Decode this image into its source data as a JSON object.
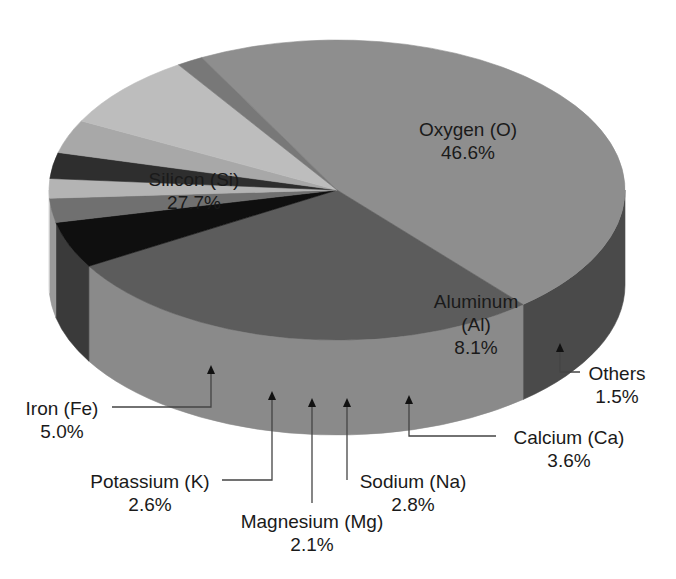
{
  "chart_data": {
    "type": "pie",
    "style": "3d",
    "title": "",
    "categories": [
      "Oxygen (O)",
      "Silicon (Si)",
      "Iron (Fe)",
      "Potassium (K)",
      "Magnesium (Mg)",
      "Sodium (Na)",
      "Calcium (Ca)",
      "Aluminum (Al)",
      "Others"
    ],
    "values": [
      46.6,
      27.7,
      5.0,
      2.6,
      2.1,
      2.8,
      3.6,
      8.1,
      1.5
    ],
    "unit": "%",
    "colors": {
      "Oxygen (O)": {
        "top": "#8e8e8e",
        "side": "#4a4a4a"
      },
      "Silicon (Si)": {
        "top": "#5c5c5c",
        "side": "#8a8a8a"
      },
      "Iron (Fe)": {
        "top": "#0f0f0f",
        "side": "#3a3a3a"
      },
      "Potassium (K)": {
        "top": "#707070",
        "side": "#9a9a9a"
      },
      "Magnesium (Mg)": {
        "top": "#b4b4b4",
        "side": "#d4d4d4"
      },
      "Sodium (Na)": {
        "top": "#2e2e2e",
        "side": "#3e3e3e"
      },
      "Calcium (Ca)": {
        "top": "#a8a8a8",
        "side": "#6e6e6e"
      },
      "Aluminum (Al)": {
        "top": "#bdbdbd",
        "side": "#7c7c7c"
      },
      "Others": {
        "top": "#787878",
        "side": "#1c1c1c"
      }
    },
    "legend": "none",
    "annotations": "callout labels with arrows for small slices"
  },
  "labels": {
    "oxygen": {
      "name": "Oxygen (O)",
      "value": "46.6%"
    },
    "silicon": {
      "name": "Silicon (Si)",
      "value": "27.7%"
    },
    "aluminum": {
      "name": "Aluminum",
      "symbol": "(Al)",
      "value": "8.1%"
    },
    "others": {
      "name": "Others",
      "value": "1.5%"
    },
    "calcium": {
      "name": "Calcium (Ca)",
      "value": "3.6%"
    },
    "sodium": {
      "name": "Sodium (Na)",
      "value": "2.8%"
    },
    "magnesium": {
      "name": "Magnesium (Mg)",
      "value": "2.1%"
    },
    "potassium": {
      "name": "Potassium (K)",
      "value": "2.6%"
    },
    "iron": {
      "name": "Iron (Fe)",
      "value": "5.0%"
    }
  }
}
